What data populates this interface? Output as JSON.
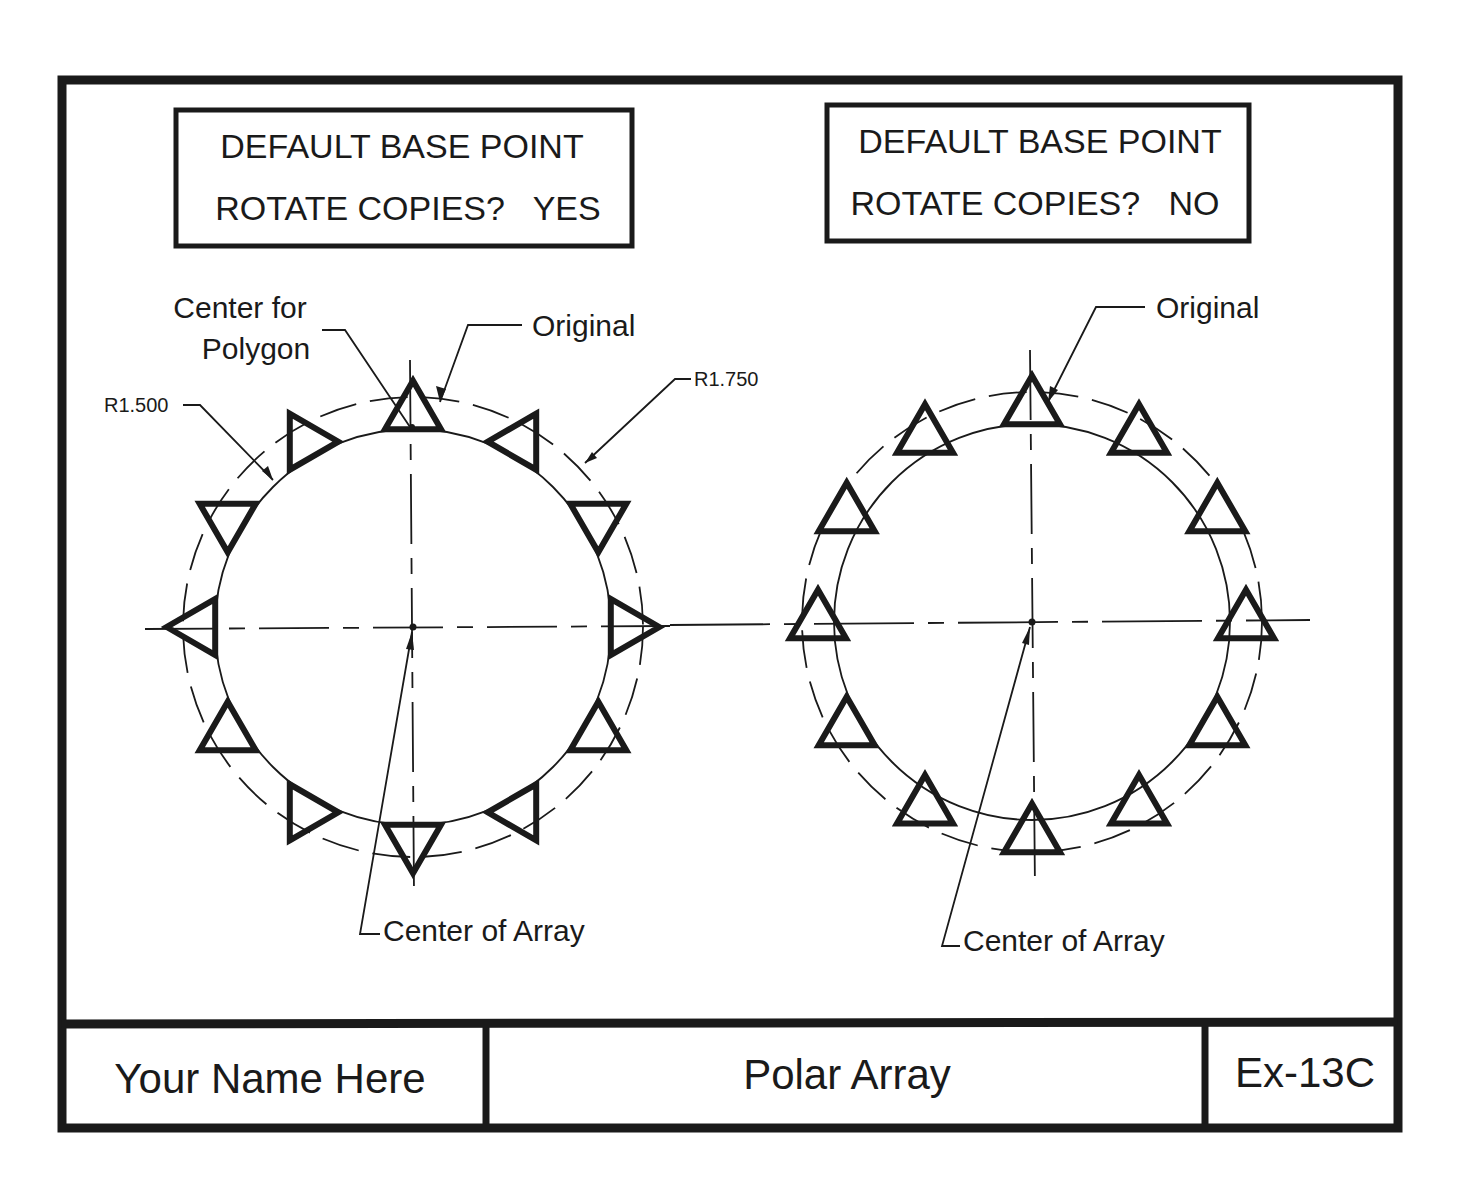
{
  "sheet": {
    "left_panel": {
      "setting_box": {
        "line1": "DEFAULT BASE POINT",
        "line2": "ROTATE COPIES?   YES"
      },
      "labels": {
        "center_for_polygon_line1": "Center for",
        "center_for_polygon_line2": "Polygon",
        "original": "Original",
        "radius_inner": "R1.500",
        "radius_outer": "R1.750",
        "center_of_array": "Center of Array"
      },
      "array": {
        "count": 12,
        "rotate_copies": true,
        "center": [
          413,
          627
        ],
        "r_solid": 198,
        "r_dashed": 230,
        "item_radius": 214
      }
    },
    "right_panel": {
      "setting_box": {
        "line1": "DEFAULT BASE POINT",
        "line2": "ROTATE COPIES?   NO"
      },
      "labels": {
        "original": "Original",
        "center_of_array": "Center of Array"
      },
      "array": {
        "count": 12,
        "rotate_copies": false,
        "center": [
          1032,
          622
        ],
        "r_solid": 198,
        "r_dashed": 230,
        "item_radius": 214
      }
    },
    "title_block": {
      "name": "Your Name Here",
      "title": "Polar Array",
      "exercise": "Ex-13C"
    }
  },
  "colors": {
    "ink": "#1a1a1a",
    "paper": "#ffffff"
  }
}
